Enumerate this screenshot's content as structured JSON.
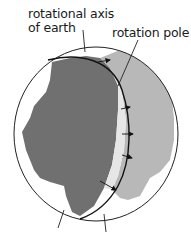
{
  "diagram": {
    "labels": {
      "axis_line1": "rotational axis",
      "axis_line2": "of earth",
      "rotation_pole": "rotation pole"
    },
    "colors": {
      "continent_dark": "#707070",
      "continent_light": "#b8b8b8",
      "outline": "#222222",
      "arc": "#111111",
      "background": "#ffffff"
    },
    "arrows_count": 5
  }
}
